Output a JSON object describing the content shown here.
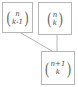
{
  "diagram": {
    "colors": {
      "background": "#ffffff",
      "box_border": "#b6b6b6",
      "connector": "#b6b6b6",
      "text": "#4a4a4a"
    },
    "paren_open": "(",
    "paren_close": ")",
    "nodes": [
      {
        "id": "binom-n-k-minus-1",
        "top": "n",
        "bottom": "k-1"
      },
      {
        "id": "binom-n-k",
        "top": "n",
        "bottom": "k"
      },
      {
        "id": "binom-n-plus-1-k",
        "top": "n+1",
        "bottom": "k"
      }
    ],
    "edges": [
      {
        "from": "binom-n-k-minus-1",
        "to": "binom-n-plus-1-k",
        "style": "diagonal"
      },
      {
        "from": "binom-n-k",
        "to": "binom-n-plus-1-k",
        "style": "vertical"
      }
    ]
  }
}
